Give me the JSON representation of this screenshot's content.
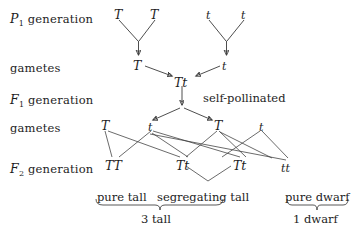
{
  "diagram": {
    "row_labels": [
      {
        "name": "p1-generation",
        "letter": "P",
        "sub": "1",
        "text": "generation",
        "x": 10,
        "y": 11
      },
      {
        "name": "gametes-1",
        "plain": "gametes",
        "x": 10,
        "y": 61
      },
      {
        "name": "f1-generation",
        "letter": "F",
        "sub": "1",
        "text": "generation",
        "x": 10,
        "y": 92
      },
      {
        "name": "gametes-2",
        "plain": "gametes",
        "x": 10,
        "y": 121
      },
      {
        "name": "f2-generation",
        "letter": "F",
        "sub": "2",
        "text": "generation",
        "x": 10,
        "y": 161
      }
    ],
    "alleles": [
      {
        "name": "p1-parent-left-allele",
        "text": "T",
        "x": 114,
        "y": 9,
        "size": "big"
      },
      {
        "name": "p1-parent-left-allele-2",
        "text": "T",
        "x": 150,
        "y": 9,
        "size": "big"
      },
      {
        "name": "p1-parent-right-allele",
        "text": "t",
        "x": 206,
        "y": 9,
        "size": "small"
      },
      {
        "name": "p1-parent-right-allele-2",
        "text": "t",
        "x": 241,
        "y": 9,
        "size": "small"
      },
      {
        "name": "gamete-p1-left",
        "text": "T",
        "x": 133,
        "y": 60,
        "size": "big"
      },
      {
        "name": "gamete-p1-right",
        "text": "t",
        "x": 222,
        "y": 61,
        "size": "small"
      },
      {
        "name": "f1-genotype",
        "text": "Tt",
        "x": 174,
        "y": 77,
        "size": "big"
      },
      {
        "name": "f2-gamete-1",
        "text": "T",
        "x": 101,
        "y": 120,
        "size": "big"
      },
      {
        "name": "f2-gamete-2",
        "text": "t",
        "x": 148,
        "y": 121,
        "size": "small"
      },
      {
        "name": "f2-gamete-3",
        "text": "T",
        "x": 214,
        "y": 120,
        "size": "big"
      },
      {
        "name": "f2-gamete-4",
        "text": "t",
        "x": 259,
        "y": 121,
        "size": "small"
      },
      {
        "name": "f2-genotype-tt-homozygous-dominant",
        "text": "TT",
        "x": 105,
        "y": 160,
        "size": "big"
      },
      {
        "name": "f2-genotype-tt-heterozygous-1",
        "text": "Tt",
        "x": 176,
        "y": 160,
        "size": "big"
      },
      {
        "name": "f2-genotype-tt-heterozygous-2",
        "text": "Tt",
        "x": 233,
        "y": 160,
        "size": "big"
      },
      {
        "name": "f2-genotype-tt-homozygous-recessive",
        "text": "tt",
        "x": 281,
        "y": 162,
        "size": "small"
      }
    ],
    "notes": [
      {
        "name": "self-pollinated-note",
        "text": "self-pollinated",
        "x": 203,
        "y": 91
      }
    ],
    "captions": [
      {
        "name": "caption-pure-tall",
        "text": "pure tall",
        "x": 97,
        "y": 190
      },
      {
        "name": "caption-segregating-tall",
        "text": "segregating tall",
        "x": 157,
        "y": 190
      },
      {
        "name": "caption-pure-dwarf",
        "text": "pure dwarf",
        "x": 285,
        "y": 190
      },
      {
        "name": "caption-3-tall",
        "text": "3 tall",
        "x": 143,
        "y": 212
      },
      {
        "name": "caption-1-dwarf",
        "text": "1 dwarf",
        "x": 295,
        "y": 212
      }
    ],
    "colors": {
      "stroke": "#3a3a3a",
      "text": "#1d1d1d",
      "background": "#ffffff"
    }
  }
}
